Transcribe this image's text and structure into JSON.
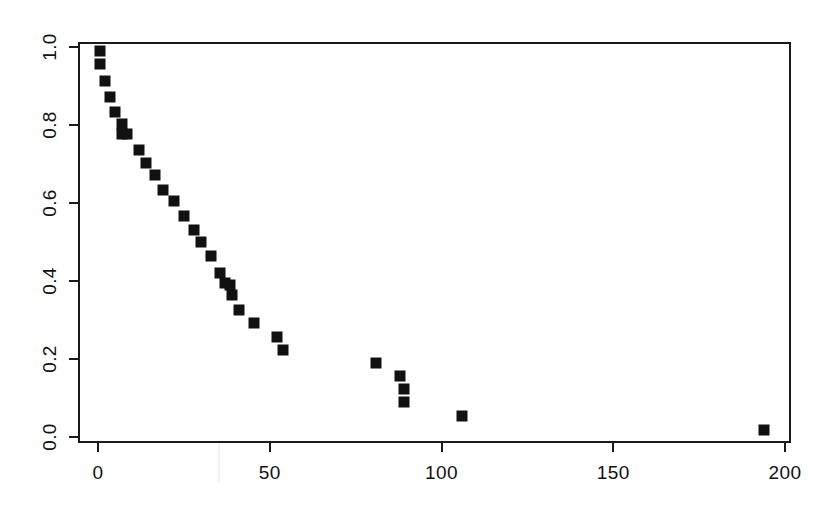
{
  "figure": {
    "background_color": "#ffffff",
    "foreground_color": "#111111",
    "marker_color": "#111111",
    "frame_color": "#1a1a1a"
  },
  "chart_data": {
    "type": "scatter",
    "title": "",
    "subtitle": "",
    "xlabel": "",
    "ylabel": "",
    "xlim": [
      -5,
      205
    ],
    "ylim": [
      -0.02,
      1.02
    ],
    "grid": false,
    "legend": null,
    "marker": "filled-square",
    "xticks": [
      0,
      50,
      100,
      150,
      200
    ],
    "xtick_labels": [
      "0",
      "50",
      "100",
      "150",
      "200"
    ],
    "yticks": [
      0.0,
      0.2,
      0.4,
      0.6,
      0.8,
      1.0
    ],
    "ytick_labels": [
      "0.0",
      "0.2",
      "0.4",
      "0.6",
      "0.8",
      "1.0"
    ],
    "x": [
      0.5,
      0.5,
      2.0,
      3.5,
      5.0,
      7.0,
      7.0,
      8.5,
      12.0,
      14.0,
      16.5,
      19.0,
      22.0,
      25.0,
      28.0,
      30.0,
      33.0,
      35.5,
      37.0,
      38.5,
      39.0,
      41.0,
      45.5,
      52.0,
      54.0,
      81.0,
      88.0,
      89.0,
      89.0,
      106.0,
      194.0
    ],
    "y": [
      0.99,
      0.956,
      0.913,
      0.872,
      0.833,
      0.803,
      0.777,
      0.777,
      0.736,
      0.703,
      0.672,
      0.633,
      0.605,
      0.567,
      0.532,
      0.5,
      0.464,
      0.421,
      0.395,
      0.39,
      0.364,
      0.326,
      0.292,
      0.256,
      0.223,
      0.19,
      0.156,
      0.123,
      0.09,
      0.054,
      0.018
    ],
    "n_points": 31
  }
}
